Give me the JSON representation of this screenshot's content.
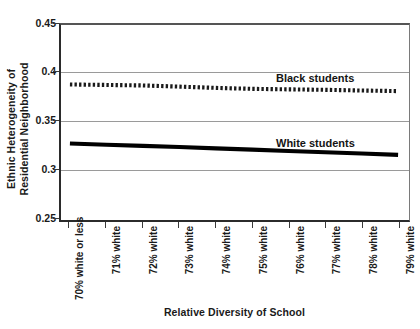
{
  "chart_data": {
    "type": "line",
    "title": "",
    "xlabel": "Relative Diversity of School",
    "ylabel": "Ethnic Heterogeneity of Residential Neighborhood",
    "ylabel_lines": [
      "Ethnic Heterogeneity of",
      "Residential Neighborhood"
    ],
    "categories": [
      "70% white or less",
      "71% white",
      "72% white",
      "73% white",
      "74% white",
      "75% white",
      "76% white",
      "77% white",
      "78% white",
      "79% white"
    ],
    "ylim": [
      0.25,
      0.45
    ],
    "yticks": [
      0.45,
      0.4,
      0.35,
      0.3,
      0.25
    ],
    "ytick_labels": [
      "0.45",
      "0.4",
      "0.35",
      "0.3",
      "0.25"
    ],
    "gridlines": [
      0.4,
      0.35,
      0.3
    ],
    "grid": true,
    "legend_position": "inline-right",
    "series": [
      {
        "name": "Black students",
        "style": "dotted",
        "color": "#1a1a1a",
        "values": [
          0.389,
          0.3885,
          0.388,
          0.3868,
          0.3855,
          0.3845,
          0.384,
          0.3835,
          0.3828,
          0.3822
        ]
      },
      {
        "name": "White students",
        "style": "solid",
        "color": "#000000",
        "values": [
          0.3285,
          0.3272,
          0.326,
          0.3248,
          0.3235,
          0.3222,
          0.3208,
          0.3195,
          0.3182,
          0.3168
        ]
      }
    ],
    "annotations": [
      {
        "text": "Black students",
        "series": "Black students"
      },
      {
        "text": "White students",
        "series": "White students"
      }
    ]
  }
}
